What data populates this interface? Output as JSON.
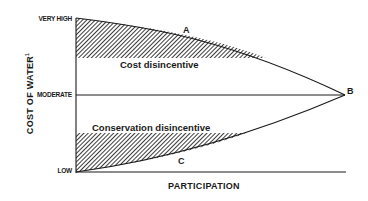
{
  "diagram": {
    "y_axis": {
      "label": "COST OF WATER",
      "label_footnote": "1",
      "ticks": [
        "VERY HIGH",
        "MODERATE",
        "LOW"
      ]
    },
    "x_axis": {
      "label": "PARTICIPATION"
    },
    "regions": {
      "upper": "Cost disincentive",
      "lower": "Conservation disincentive"
    },
    "points": {
      "a": "A",
      "b": "B",
      "c": "C"
    }
  }
}
